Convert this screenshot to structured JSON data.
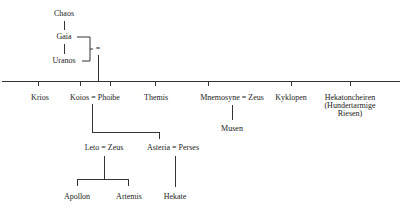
{
  "diagram": {
    "type": "genealogy",
    "nodes": {
      "chaos": "Chaos",
      "gaia": "Gaia",
      "uranos": "Uranos",
      "marriage_sign": "=",
      "krios": "Krios",
      "koios_phoibe": "Koios = Phoibe",
      "themis": "Themis",
      "mnemosyne_zeus": "Mnemosyne = Zeus",
      "kyklopen": "Kyklopen",
      "hekatoncheiren": "Hekatoncheiren",
      "hekatoncheiren_note1": "(Hundertarmige",
      "hekatoncheiren_note2": "Riesen)",
      "musen": "Musen",
      "leto_zeus": "Leto = Zeus",
      "asteria_perses": "Asteria = Perses",
      "apollon": "Apollon",
      "artemis": "Artemis",
      "hekate": "Hekate"
    },
    "edges": [
      [
        "Chaos",
        "Gaia"
      ],
      [
        "Gaia",
        "Uranos"
      ],
      [
        "Gaia = Uranos",
        "Krios"
      ],
      [
        "Gaia = Uranos",
        "Koios"
      ],
      [
        "Gaia = Uranos",
        "Phoibe"
      ],
      [
        "Gaia = Uranos",
        "Themis"
      ],
      [
        "Gaia = Uranos",
        "Mnemosyne"
      ],
      [
        "Gaia = Uranos",
        "Kyklopen"
      ],
      [
        "Gaia = Uranos",
        "Hekatoncheiren"
      ],
      [
        "Mnemosyne = Zeus",
        "Musen"
      ],
      [
        "Koios = Phoibe",
        "Leto"
      ],
      [
        "Koios = Phoibe",
        "Asteria"
      ],
      [
        "Leto = Zeus",
        "Apollon"
      ],
      [
        "Leto = Zeus",
        "Artemis"
      ],
      [
        "Asteria = Perses",
        "Hekate"
      ]
    ]
  }
}
